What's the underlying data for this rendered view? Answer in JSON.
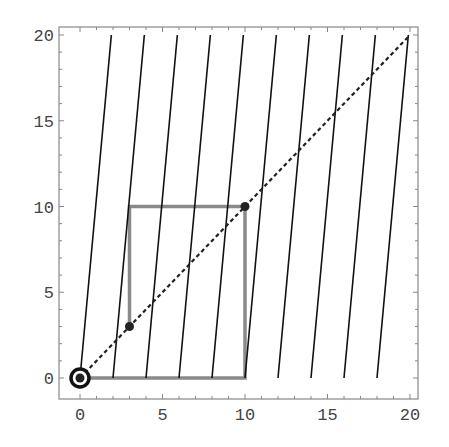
{
  "chart_data": {
    "type": "line",
    "title": "",
    "xlabel": "",
    "ylabel": "",
    "xlim": [
      -1,
      20.5
    ],
    "ylim": [
      -1.2,
      20.5
    ],
    "grid": false,
    "legend": null,
    "x_ticks": [
      0,
      5,
      10,
      15,
      20
    ],
    "y_ticks": [
      0,
      5,
      10,
      15,
      20
    ],
    "series": [
      {
        "name": "diagonal",
        "style": "dashed",
        "color": "#222222",
        "points": [
          [
            0,
            0
          ],
          [
            20,
            20
          ]
        ]
      },
      {
        "name": "slanted-lines",
        "style": "solid",
        "color": "#111111",
        "segments": [
          [
            [
              0,
              0
            ],
            [
              1.9,
              20
            ]
          ],
          [
            [
              2,
              0
            ],
            [
              3.9,
              20
            ]
          ],
          [
            [
              4,
              0
            ],
            [
              5.9,
              20
            ]
          ],
          [
            [
              6,
              0
            ],
            [
              7.9,
              20
            ]
          ],
          [
            [
              8,
              0
            ],
            [
              9.9,
              20
            ]
          ],
          [
            [
              10,
              0
            ],
            [
              11.9,
              20
            ]
          ],
          [
            [
              12,
              0
            ],
            [
              13.9,
              20
            ]
          ],
          [
            [
              14,
              0
            ],
            [
              15.9,
              20
            ]
          ],
          [
            [
              16,
              0
            ],
            [
              17.9,
              20
            ]
          ],
          [
            [
              18,
              0
            ],
            [
              19.9,
              20
            ]
          ]
        ]
      },
      {
        "name": "orbit-path",
        "style": "solid",
        "color": "#8a8a8a",
        "points": [
          [
            3,
            3
          ],
          [
            3,
            10
          ],
          [
            10,
            10
          ],
          [
            10,
            0
          ],
          [
            0,
            0
          ]
        ]
      },
      {
        "name": "orbit-points",
        "style": "markers",
        "color": "#222222",
        "points": [
          [
            0,
            0
          ],
          [
            3,
            3
          ],
          [
            10,
            10
          ]
        ]
      }
    ],
    "annotations": [
      {
        "type": "ring",
        "at": [
          0,
          0
        ]
      }
    ]
  }
}
